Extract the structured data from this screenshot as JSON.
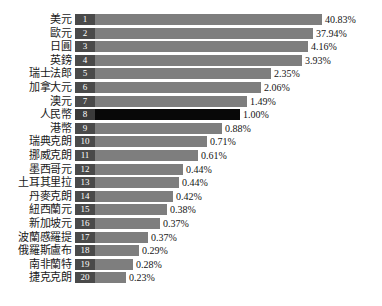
{
  "chart_data": {
    "type": "bar",
    "orientation": "horizontal",
    "title": "",
    "xlabel": "",
    "ylabel": "",
    "grid": false,
    "legend": null,
    "value_suffix": "%",
    "highlight_category": "人民幣",
    "categories": [
      "美元",
      "歐元",
      "日圓",
      "英鎊",
      "瑞士法郎",
      "加拿大元",
      "澳元",
      "人民幣",
      "港幣",
      "瑞典克朗",
      "挪威克朗",
      "墨西哥元",
      "土耳其里拉",
      "丹麥克朗",
      "紐西蘭元",
      "新加坡元",
      "波蘭慼羅提",
      "俄羅斯盧布",
      "南非蘭特",
      "捷克克朗"
    ],
    "values": [
      40.83,
      37.94,
      4.16,
      3.93,
      2.35,
      2.06,
      1.49,
      1.0,
      0.88,
      0.71,
      0.61,
      0.44,
      0.44,
      0.42,
      0.38,
      0.37,
      0.37,
      0.29,
      0.28,
      0.23
    ],
    "value_labels": [
      "40.83%",
      "37.94%",
      "4.16%",
      "3.93%",
      "2.35%",
      "2.06%",
      "1.49%",
      "1.00%",
      "0.88%",
      "0.71%",
      "0.61%",
      "0.44%",
      "0.44%",
      "0.42%",
      "0.38%",
      "0.37%",
      "0.37%",
      "0.29%",
      "0.28%",
      "0.23%"
    ],
    "ranks": [
      "1",
      "2",
      "3",
      "4",
      "5",
      "6",
      "7",
      "8",
      "9",
      "10",
      "11",
      "12",
      "13",
      "14",
      "15",
      "16",
      "17",
      "18",
      "19",
      "20"
    ],
    "bar_pixel_lengths": [
      247,
      238,
      233,
      227,
      196,
      186,
      172,
      165,
      147,
      132,
      123,
      108,
      104,
      98,
      92,
      85,
      73,
      64,
      58,
      51
    ],
    "colors": {
      "bar": "#7e7e7e",
      "bar_highlight": "#080808",
      "rank_badge": "#4a4a4a",
      "rank_text": "#ffffff",
      "label_text": "#1a1a1a",
      "value_text": "#141414",
      "background": "#ffffff"
    },
    "ylim": [
      0,
      41
    ]
  }
}
